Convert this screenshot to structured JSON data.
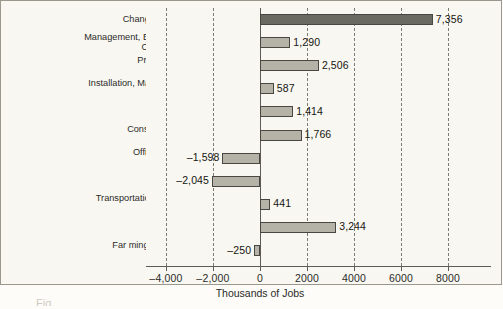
{
  "chart_data": {
    "type": "bar",
    "orientation": "horizontal",
    "title": "",
    "xlabel": "Thousands of Jobs",
    "ylabel": "",
    "xlim": [
      -4800,
      8600
    ],
    "xticks": [
      -4000,
      -2000,
      0,
      2000,
      4000,
      6000,
      8000
    ],
    "xticklabels": [
      "–4,000",
      "–2,000",
      "0",
      "2000",
      "4000",
      "6000",
      "8000"
    ],
    "grid": "vertical-dashed",
    "legend": "none",
    "categories": [
      "Change in Total Employment",
      "Management, Business, and Financial\nOperations Occupations",
      "Professional and Related\nOccupations",
      "Installation, Maintenance, and Repair\nOccupations",
      "Sales and Related\nOccupations",
      "Construction and Extraction\nOccupations",
      "Office and Admin. Support\nOccupations",
      "Production\nOccupations",
      "Transportation and Material Moving\nOccupations",
      "Service\nOccupations",
      "Far ming, Fishing, and Forestry\nOccupations"
    ],
    "values": [
      7356,
      1290,
      2506,
      587,
      1414,
      1766,
      -1598,
      -2045,
      441,
      3244,
      -250
    ],
    "value_labels": [
      "7,356",
      "1,290",
      "2,506",
      "587",
      "1,414",
      "1,766",
      "–1,598",
      "–2,045",
      "441",
      "3,244",
      "–250"
    ],
    "bar_colors": [
      "#6b6a62",
      "#b5b2a8",
      "#b5b2a8",
      "#b5b2a8",
      "#b5b2a8",
      "#b5b2a8",
      "#b5b2a8",
      "#b5b2a8",
      "#b5b2a8",
      "#b5b2a8",
      "#b5b2a8"
    ],
    "bar_outline_color": "#494741",
    "plot_background": "#f8f7f2",
    "axis_color": "#5d5b55",
    "gridline_color": "#7d7a72"
  },
  "caption": "Fig."
}
